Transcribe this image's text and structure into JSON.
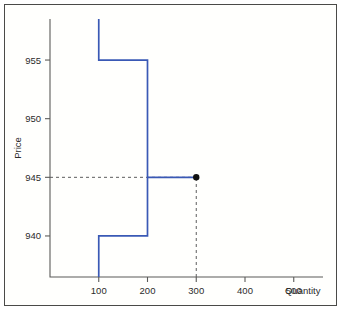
{
  "chart_data": {
    "type": "line",
    "title": "",
    "subtitle": "",
    "xlabel": "Quantity",
    "ylabel": "Price",
    "xlim": [
      0,
      560
    ],
    "ylim": [
      936.5,
      958.5
    ],
    "grid": false,
    "legend": null,
    "xticks": [
      100,
      200,
      300,
      400,
      500
    ],
    "xtick_labels": [
      "100",
      "200",
      "300",
      "400",
      "500"
    ],
    "yticks": [
      940,
      945,
      950,
      955
    ],
    "ytick_labels": [
      "940",
      "945",
      "950",
      "955"
    ],
    "series": [
      {
        "name": "supply-schedule",
        "style": "step",
        "color": "#3a59b5",
        "points": [
          {
            "x": 100,
            "y": 936.5
          },
          {
            "x": 100,
            "y": 940
          },
          {
            "x": 200,
            "y": 940
          },
          {
            "x": 200,
            "y": 955
          },
          {
            "x": 100,
            "y": 955
          },
          {
            "x": 100,
            "y": 958.5
          }
        ],
        "step_levels": [
          {
            "price": 940,
            "q_start": 100,
            "q_end": 200
          },
          {
            "price": 955,
            "q_start": 100,
            "q_end": 200
          },
          {
            "price": 945,
            "q_start": 200,
            "q_end": 300
          }
        ]
      },
      {
        "name": "clearing-segment",
        "style": "step",
        "color": "#3a59b5",
        "points": [
          {
            "x": 200,
            "y": 945
          },
          {
            "x": 300,
            "y": 945
          }
        ]
      }
    ],
    "annotations": [
      {
        "name": "clearing-point",
        "type": "marker",
        "x": 300,
        "y": 945,
        "color": "#111111",
        "marker": "filled-circle"
      },
      {
        "name": "price-guide",
        "type": "dashed-line",
        "orientation": "horizontal",
        "y": 945,
        "x_from": 0,
        "x_to": 300,
        "color": "#5d5d5d"
      },
      {
        "name": "quantity-guide",
        "type": "dashed-line",
        "orientation": "vertical",
        "x": 300,
        "y_from": 936.5,
        "y_to": 945,
        "color": "#5d5d5d"
      }
    ]
  },
  "figure": {
    "border_color": "#4a4a48",
    "background": "#ffffff",
    "axis_color": "#5b5b59",
    "series_color": "#3a59b5",
    "marker_color": "#111111",
    "guide_color": "#5d5d5d"
  }
}
